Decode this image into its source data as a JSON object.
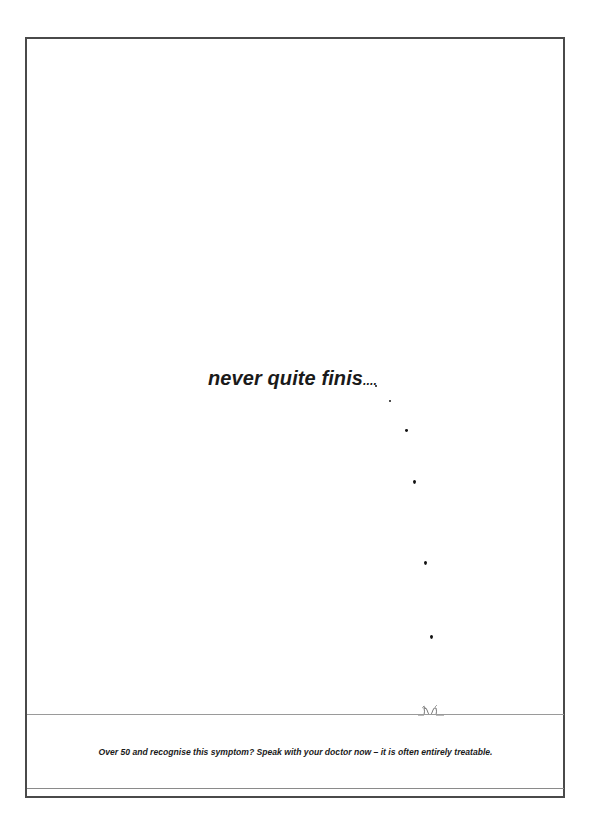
{
  "poster": {
    "headline": "never quite finis",
    "headline_trail": "....",
    "tagline": "Over 50 and recognise this symptom? Speak with your doctor now – it is often entirely treatable.",
    "colors": {
      "text": "#1a1a1a",
      "frame": "#4a4a4a",
      "divider": "#9a9a9a",
      "background": "#ffffff"
    }
  }
}
